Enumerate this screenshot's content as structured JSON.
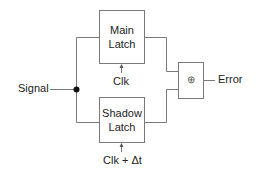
{
  "diagram": {
    "type": "block-diagram",
    "title": "",
    "colors": {
      "stroke": "#7a7a7a",
      "text": "#222222",
      "junction": "#111111",
      "background": "#ffffff"
    },
    "input": {
      "label": "Signal"
    },
    "blocks": {
      "main_latch": {
        "line1": "Main",
        "line2": "Latch",
        "clock_label": "Clk"
      },
      "shadow_latch": {
        "line1": "Shadow",
        "line2": "Latch",
        "clock_label": "Clk + Δt"
      },
      "xor": {
        "symbol": "⊕"
      }
    },
    "output": {
      "label": "Error"
    },
    "connections": [
      {
        "from": "Signal",
        "to": "Main Latch"
      },
      {
        "from": "Signal",
        "to": "Shadow Latch"
      },
      {
        "from": "Clk",
        "to": "Main Latch"
      },
      {
        "from": "Clk + Δt",
        "to": "Shadow Latch"
      },
      {
        "from": "Main Latch",
        "to": "⊕"
      },
      {
        "from": "Shadow Latch",
        "to": "⊕"
      },
      {
        "from": "⊕",
        "to": "Error"
      }
    ]
  }
}
